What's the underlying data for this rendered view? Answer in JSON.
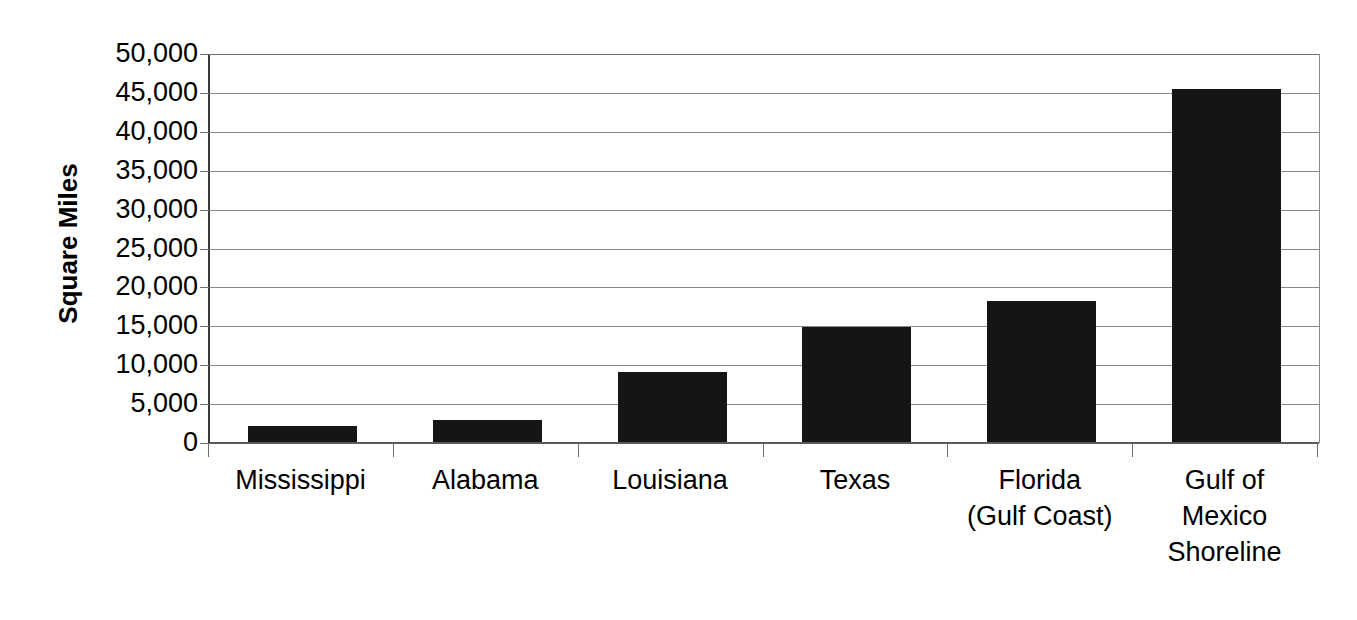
{
  "chart_data": {
    "type": "bar",
    "title": "",
    "subtitle": "",
    "xlabel": "",
    "ylabel": "Square Miles",
    "categories": [
      "Mississippi",
      "Alabama",
      "Louisiana",
      "Texas",
      "Florida\n(Gulf Coast)",
      "Gulf of\nMexico\nShoreline"
    ],
    "values": [
      2200,
      2950,
      9150,
      14900,
      18300,
      45500
    ],
    "ylim": [
      0,
      50000
    ],
    "ytick_values": [
      50000,
      45000,
      40000,
      35000,
      30000,
      25000,
      20000,
      15000,
      10000,
      5000,
      0
    ],
    "ytick_labels": [
      "50,000",
      "45,000",
      "40,000",
      "35,000",
      "30,000",
      "25,000",
      "20,000",
      "15,000",
      "10,000",
      "5,000",
      "0"
    ],
    "grid": true,
    "legend": false,
    "legend_position": "none",
    "bar_color": "#151515",
    "background_color": "#ffffff",
    "axis_color": "#6f6f6f"
  }
}
